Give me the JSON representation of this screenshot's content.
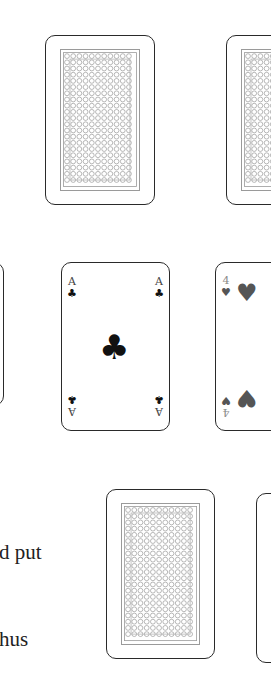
{
  "colors": {
    "card_border": "#2a2a2a",
    "club": "#111111",
    "heart": "#555555",
    "pattern": "#9a9a9a"
  },
  "cards": [
    {
      "id": "back-1",
      "face": "back",
      "x": 45,
      "y": 35,
      "w": 110,
      "h": 170
    },
    {
      "id": "back-2",
      "face": "back",
      "x": 226,
      "y": 35,
      "w": 110,
      "h": 170
    },
    {
      "id": "partial-left",
      "face": "unknown",
      "x": -100,
      "y": 262,
      "w": 104,
      "h": 144
    },
    {
      "id": "ace-of-clubs",
      "face": "up",
      "rank": "A",
      "suit": "♣",
      "suit_name": "clubs",
      "x": 61,
      "y": 262,
      "w": 109,
      "h": 169
    },
    {
      "id": "four-of-hearts",
      "face": "up",
      "rank": "4",
      "suit": "♥",
      "suit_name": "hearts",
      "x": 215,
      "y": 262,
      "w": 109,
      "h": 169
    },
    {
      "id": "back-3",
      "face": "back",
      "x": 106,
      "y": 489,
      "w": 109,
      "h": 170
    },
    {
      "id": "back-4",
      "face": "back",
      "x": 256,
      "y": 493,
      "w": 109,
      "h": 170
    }
  ],
  "ace": {
    "rank": "A",
    "suit": "♣"
  },
  "four": {
    "rank": "4",
    "suit": "♥"
  },
  "text": {
    "line1": "d put",
    "line2": "hus"
  }
}
